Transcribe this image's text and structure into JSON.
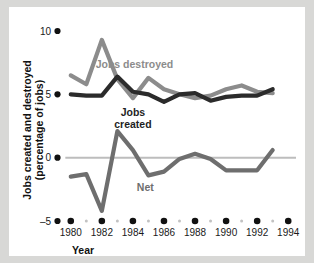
{
  "chart_data": {
    "type": "line",
    "title": "",
    "xlabel": "Year",
    "ylabel": "Jobs created and destroyed (percentage of jobs)",
    "x": [
      1980,
      1981,
      1982,
      1983,
      1984,
      1985,
      1986,
      1987,
      1988,
      1989,
      1990,
      1991,
      1992,
      1993
    ],
    "xlim": [
      1979.5,
      1994.5
    ],
    "ylim": [
      -5,
      10
    ],
    "yticks": [
      -5,
      0,
      5,
      10
    ],
    "ytick_labels": [
      "–5",
      "0",
      "5",
      "10"
    ],
    "xticks": [
      1980,
      1981,
      1982,
      1983,
      1984,
      1985,
      1986,
      1987,
      1988,
      1989,
      1990,
      1991,
      1992,
      1993,
      1994
    ],
    "xtick_labels": [
      "1980",
      "1982",
      "1984",
      "1986",
      "1988",
      "1990",
      "1992",
      "1994"
    ],
    "xtick_major": [
      1980,
      1982,
      1984,
      1986,
      1988,
      1990,
      1992,
      1994
    ],
    "grid": false,
    "zero_line": true,
    "legend_position": "inline-annotations",
    "series": [
      {
        "name": "Jobs destroyed",
        "color": "#8c8c8c",
        "values": [
          6.5,
          5.8,
          9.3,
          6.2,
          4.7,
          6.3,
          5.4,
          5.0,
          4.7,
          4.9,
          5.4,
          5.7,
          5.2,
          5.1
        ]
      },
      {
        "name": "Jobs created",
        "color": "#2b2b2b",
        "values": [
          5.0,
          4.9,
          4.9,
          6.4,
          5.2,
          5.0,
          4.4,
          5.0,
          5.1,
          4.5,
          4.8,
          4.9,
          4.9,
          5.4
        ]
      },
      {
        "name": "Net",
        "color": "#6e6e6e",
        "values": [
          -1.5,
          -1.3,
          -4.2,
          2.1,
          0.6,
          -1.4,
          -1.1,
          -0.1,
          0.3,
          -0.1,
          -1.0,
          -1.0,
          -1.0,
          0.6
        ]
      }
    ],
    "annotations": [
      {
        "text": "Jobs destroyed",
        "x": 1984.1,
        "y": 7.1,
        "color": "#8c8c8c",
        "name": "jobs-destroyed-label"
      },
      {
        "text": "Jobs",
        "x": 1984.0,
        "y": 3.3,
        "color": "#1f1f1f",
        "name": "jobs-created-label-line1"
      },
      {
        "text": "created",
        "x": 1984.0,
        "y": 2.35,
        "color": "#1f1f1f",
        "name": "jobs-created-label-line2"
      },
      {
        "text": "Net",
        "x": 1984.8,
        "y": -2.6,
        "color": "#6e6e6e",
        "name": "net-label"
      }
    ]
  },
  "axes": {
    "x_title": "Year",
    "y_title_line1": "Jobs created and destroyed",
    "y_title_line2": "(percentage of jobs)"
  },
  "colors": {
    "page_background": "#d8d8d6",
    "figure_background": "#ffffff",
    "destroyed": "#8c8c8c",
    "created": "#2b2b2b",
    "net": "#6e6e6e",
    "zero_line": "#bdbdbd",
    "tick_dot": "#111111",
    "minor_tick_dot": "#c2c2c2",
    "text": "#1a1a1a"
  }
}
